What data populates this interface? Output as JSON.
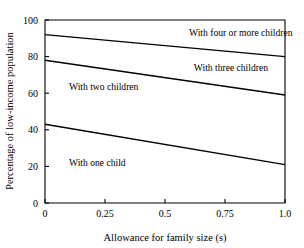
{
  "chart_data": {
    "type": "line",
    "title": "",
    "subtitle": "",
    "xlabel": "Allowance for family size (s)",
    "ylabel": "Percentage of low-income population",
    "xlim": [
      0,
      1.0
    ],
    "ylim": [
      0,
      100
    ],
    "xticks": [
      0,
      0.25,
      0.5,
      0.75,
      1.0
    ],
    "xtick_labels": [
      "0",
      "0.25",
      "0.5",
      "0.75",
      "1.0"
    ],
    "yticks": [
      0,
      20,
      40,
      60,
      80,
      100
    ],
    "ytick_labels": [
      "0",
      "20",
      "40",
      "60",
      "80",
      "100"
    ],
    "grid": false,
    "legend_position": "inline-annotations",
    "line_color": "#000000",
    "series": [
      {
        "name": "With four or more children",
        "label": "With four or more children",
        "x": [
          0,
          1.0
        ],
        "values": [
          92,
          80
        ],
        "label_x": 0.6,
        "label_y": 91
      },
      {
        "name": "With three children",
        "label": "With three children",
        "x": [
          0,
          1.0
        ],
        "values": [
          78,
          59
        ],
        "label_x": 0.62,
        "label_y": 72
      },
      {
        "name": "With two children",
        "label": "With two children",
        "x": [
          0,
          1.0
        ],
        "values": [
          78,
          59
        ],
        "label_x": 0.1,
        "label_y": 62,
        "label_only": true
      },
      {
        "name": "With one child",
        "label": "With one child",
        "x": [
          0,
          1.0
        ],
        "values": [
          43,
          21
        ],
        "label_x": 0.1,
        "label_y": 20
      }
    ],
    "annotations": [
      {
        "text": "With four or more children",
        "x": 0.6,
        "y": 91
      },
      {
        "text": "With three children",
        "x": 0.62,
        "y": 72
      },
      {
        "text": "With two children",
        "x": 0.1,
        "y": 62
      },
      {
        "text": "With one child",
        "x": 0.1,
        "y": 20
      }
    ]
  }
}
